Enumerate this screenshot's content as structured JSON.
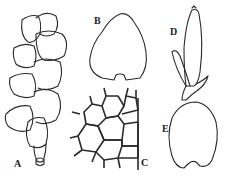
{
  "figure": {
    "panels": [
      {
        "id": "A",
        "label": "A",
        "subject": "shoot-with-overlapping-leaves"
      },
      {
        "id": "B",
        "label": "B",
        "subject": "single-leaf"
      },
      {
        "id": "C",
        "label": "C",
        "subject": "leaf-cells"
      },
      {
        "id": "D",
        "label": "D",
        "subject": "perianth-with-bracts"
      },
      {
        "id": "E",
        "label": "E",
        "subject": "underleaf"
      }
    ]
  }
}
